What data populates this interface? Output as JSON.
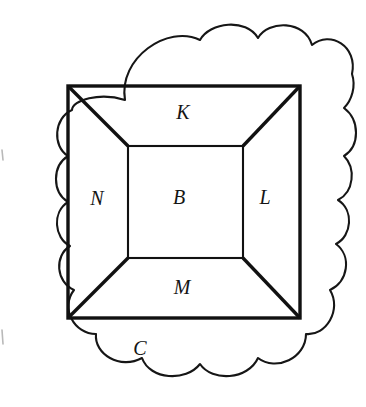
{
  "figure": {
    "background_color": "#ffffff",
    "ink_color": "#111111",
    "cloud_stroke_color": "#161616",
    "labels": {
      "outer_region": "C",
      "top_region": "K",
      "left_region": "N",
      "center_region": "B",
      "right_region": "L",
      "bottom_region": "M"
    },
    "label_positions": {
      "outer_region": {
        "x": 140,
        "y": 350
      },
      "top_region": {
        "x": 183,
        "y": 114
      },
      "left_region": {
        "x": 97,
        "y": 200
      },
      "center_region": {
        "x": 179,
        "y": 199
      },
      "right_region": {
        "x": 265,
        "y": 199
      },
      "bottom_region": {
        "x": 182,
        "y": 289
      }
    },
    "geometry": {
      "outer_square": {
        "left": 68,
        "top": 86,
        "right": 300,
        "bottom": 318
      },
      "inner_square": {
        "left": 128,
        "top": 146,
        "right": 243,
        "bottom": 258
      },
      "diagonals": [
        {
          "from": "outer-top-left",
          "to": "inner-top-left"
        },
        {
          "from": "outer-top-right",
          "to": "inner-top-right"
        },
        {
          "from": "outer-bottom-left",
          "to": "inner-bottom-left"
        },
        {
          "from": "outer-bottom-right",
          "to": "inner-bottom-right"
        }
      ],
      "cloud_bumps": {
        "top": 3,
        "right": 3,
        "bottom": 3,
        "left": 3
      }
    }
  }
}
